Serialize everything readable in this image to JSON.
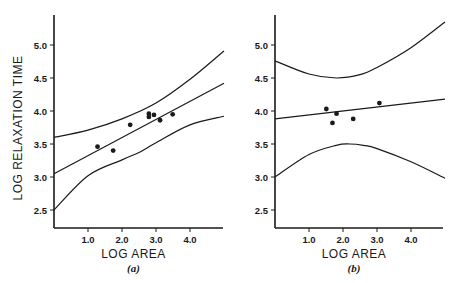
{
  "figure": {
    "background": "#ffffff",
    "ink_color": "#1a1a1a",
    "shared_ylabel": "LOG RELAXATION TIME"
  },
  "chart_data": [
    {
      "type": "scatter",
      "panel_label": "(a)",
      "title": "",
      "xlabel": "LOG AREA",
      "ylabel": "LOG RELAXATION TIME",
      "xlim": [
        0,
        5.0
      ],
      "ylim": [
        2.25,
        5.5
      ],
      "xticks": [
        1.0,
        2.0,
        3.0,
        4.0
      ],
      "xtick_labels": [
        "1.0",
        "2.0",
        "3.0",
        "4.0"
      ],
      "yticks": [
        2.5,
        3.0,
        3.5,
        4.0,
        4.5,
        5.0
      ],
      "ytick_labels": [
        "2.5",
        "3.0",
        "3.5",
        "4.0",
        "4.5",
        "5.0"
      ],
      "grid": false,
      "points": [
        {
          "x": 1.28,
          "y": 3.46
        },
        {
          "x": 1.74,
          "y": 3.4
        },
        {
          "x": 2.24,
          "y": 3.79
        },
        {
          "x": 2.79,
          "y": 3.96
        },
        {
          "x": 2.79,
          "y": 3.91
        },
        {
          "x": 2.94,
          "y": 3.94
        },
        {
          "x": 3.12,
          "y": 3.86
        },
        {
          "x": 3.49,
          "y": 3.95
        }
      ],
      "series": [
        {
          "name": "regression line",
          "x": [
            0,
            5.0
          ],
          "y": [
            3.05,
            4.42
          ]
        },
        {
          "name": "upper confidence band",
          "x": [
            0,
            1.0,
            2.0,
            3.0,
            4.0,
            5.0
          ],
          "y": [
            3.6,
            3.71,
            3.88,
            4.12,
            4.48,
            4.91
          ]
        },
        {
          "name": "lower confidence band",
          "x": [
            0,
            1.0,
            2.0,
            2.53,
            3.0,
            4.0,
            5.0
          ],
          "y": [
            2.5,
            3.02,
            3.26,
            3.38,
            3.52,
            3.79,
            3.92
          ]
        }
      ]
    },
    {
      "type": "scatter",
      "panel_label": "(b)",
      "title": "",
      "xlabel": "LOG AREA",
      "ylabel": "",
      "xlim": [
        0,
        5.0
      ],
      "ylim": [
        2.25,
        5.5
      ],
      "xticks": [
        1.0,
        2.0,
        3.0,
        4.0
      ],
      "xtick_labels": [
        "1.0",
        "2.0",
        "3.0",
        "4.0"
      ],
      "yticks": [
        2.5,
        3.0,
        3.5,
        4.0,
        4.5,
        5.0
      ],
      "ytick_labels": [
        "2.5",
        "3.0",
        "3.5",
        "4.0",
        "4.5",
        "5.0"
      ],
      "grid": false,
      "points": [
        {
          "x": 1.51,
          "y": 4.03
        },
        {
          "x": 1.81,
          "y": 3.96
        },
        {
          "x": 1.69,
          "y": 3.82
        },
        {
          "x": 2.3,
          "y": 3.88
        },
        {
          "x": 3.07,
          "y": 4.12
        }
      ],
      "series": [
        {
          "name": "regression line",
          "x": [
            0,
            5.0
          ],
          "y": [
            3.88,
            4.18
          ]
        },
        {
          "name": "upper confidence band",
          "x": [
            0,
            1.0,
            1.8,
            2.5,
            3.0,
            4.0,
            5.0
          ],
          "y": [
            4.76,
            4.56,
            4.5,
            4.55,
            4.66,
            4.96,
            5.35
          ]
        },
        {
          "name": "lower confidence band",
          "x": [
            0,
            1.0,
            1.8,
            2.2,
            2.6,
            3.0,
            4.0,
            5.0
          ],
          "y": [
            3.0,
            3.34,
            3.48,
            3.5,
            3.48,
            3.43,
            3.23,
            2.98
          ]
        }
      ]
    }
  ]
}
